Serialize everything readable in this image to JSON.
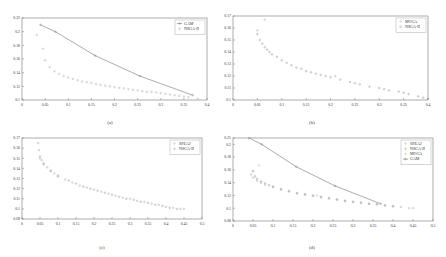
{
  "chart_data": [
    {
      "type": "scatter",
      "caption": "(a)",
      "xlim": [
        0,
        0.4
      ],
      "ylim": [
        0.1,
        0.22
      ],
      "xticks": [
        "0",
        "0.05",
        "0.1",
        "0.15",
        "0.2",
        "0.25",
        "0.3",
        "0.35",
        "0.4"
      ],
      "yticks": [
        "0.1",
        "0.12",
        "0.14",
        "0.16",
        "0.18",
        "0.2",
        "0.22"
      ],
      "legend_position": "top-right",
      "series": [
        {
          "name": "GAM",
          "style": "line-marker",
          "color": "#888888",
          "x": [
            0.04,
            0.072,
            0.158,
            0.255,
            0.369
          ],
          "y": [
            0.21,
            0.2,
            0.165,
            0.135,
            0.107
          ]
        },
        {
          "name": "NSGA-II",
          "style": "marker",
          "color": "#aaaaaa",
          "x": [
            0.032,
            0.045,
            0.05,
            0.06,
            0.07,
            0.08,
            0.09,
            0.1,
            0.11,
            0.12,
            0.13,
            0.14,
            0.15,
            0.16,
            0.17,
            0.18,
            0.19,
            0.2,
            0.21,
            0.22,
            0.23,
            0.24,
            0.25,
            0.26,
            0.27,
            0.28,
            0.29,
            0.3,
            0.31,
            0.32,
            0.33,
            0.34,
            0.35,
            0.36,
            0.38
          ],
          "y": [
            0.195,
            0.175,
            0.158,
            0.148,
            0.142,
            0.138,
            0.135,
            0.133,
            0.131,
            0.129,
            0.127,
            0.126,
            0.125,
            0.123,
            0.122,
            0.121,
            0.12,
            0.119,
            0.118,
            0.117,
            0.116,
            0.115,
            0.114,
            0.113,
            0.112,
            0.112,
            0.111,
            0.11,
            0.109,
            0.108,
            0.107,
            0.106,
            0.105,
            0.104,
            0.102
          ]
        }
      ]
    },
    {
      "type": "scatter",
      "caption": "(b)",
      "xlim": [
        0,
        0.4
      ],
      "ylim": [
        0.1,
        0.17
      ],
      "xticks": [
        "0",
        "0.05",
        "0.1",
        "0.15",
        "0.2",
        "0.25",
        "0.3",
        "0.35",
        "0.4"
      ],
      "yticks": [
        "0.1",
        "0.11",
        "0.12",
        "0.13",
        "0.14",
        "0.15",
        "0.16",
        "0.17"
      ],
      "legend_position": "top-right",
      "series": [
        {
          "name": "MOGA",
          "style": "marker",
          "color": "#aaaaaa",
          "x": [
            0.05,
            0.065,
            0.21
          ],
          "y": [
            0.158,
            0.167,
            0.12
          ]
        },
        {
          "name": "NSGA-II",
          "style": "marker",
          "color": "#999999",
          "x": [
            0.05,
            0.055,
            0.06,
            0.065,
            0.07,
            0.075,
            0.08,
            0.09,
            0.1,
            0.11,
            0.12,
            0.13,
            0.14,
            0.15,
            0.16,
            0.17,
            0.18,
            0.19,
            0.2,
            0.22,
            0.24,
            0.25,
            0.26,
            0.28,
            0.3,
            0.31,
            0.32,
            0.34,
            0.35,
            0.36,
            0.38,
            0.39,
            0.4
          ],
          "y": [
            0.155,
            0.15,
            0.147,
            0.144,
            0.142,
            0.14,
            0.138,
            0.136,
            0.133,
            0.131,
            0.129,
            0.127,
            0.126,
            0.124,
            0.123,
            0.122,
            0.121,
            0.12,
            0.119,
            0.117,
            0.115,
            0.114,
            0.113,
            0.111,
            0.11,
            0.109,
            0.108,
            0.107,
            0.106,
            0.105,
            0.103,
            0.102,
            0.101
          ]
        }
      ]
    },
    {
      "type": "scatter",
      "caption": "(c)",
      "xlim": [
        0,
        0.5
      ],
      "ylim": [
        0.09,
        0.17
      ],
      "xticks": [
        "0",
        "0.05",
        "0.1",
        "0.15",
        "0.2",
        "0.25",
        "0.3",
        "0.35",
        "0.4",
        "0.45",
        "0.5"
      ],
      "yticks": [
        "0.09",
        "0.1",
        "0.11",
        "0.12",
        "0.13",
        "0.14",
        "0.15",
        "0.16",
        "0.17"
      ],
      "legend_position": "top-right",
      "series": [
        {
          "name": "SPEA2",
          "style": "marker",
          "color": "#aaaaaa",
          "x": [
            0.045,
            0.047,
            0.05,
            0.055,
            0.06,
            0.07,
            0.08,
            0.09,
            0.1,
            0.12,
            0.14,
            0.16,
            0.18,
            0.2,
            0.22,
            0.24,
            0.26,
            0.28,
            0.3,
            0.32,
            0.34,
            0.36,
            0.38,
            0.4,
            0.42,
            0.44,
            0.45
          ],
          "y": [
            0.165,
            0.158,
            0.152,
            0.148,
            0.145,
            0.141,
            0.138,
            0.135,
            0.133,
            0.129,
            0.126,
            0.123,
            0.121,
            0.119,
            0.117,
            0.115,
            0.113,
            0.111,
            0.11,
            0.108,
            0.107,
            0.105,
            0.104,
            0.102,
            0.101,
            0.1,
            0.1
          ]
        },
        {
          "name": "NSGA-II",
          "style": "marker",
          "color": "#999999",
          "x": [
            0.05,
            0.06,
            0.08,
            0.1,
            0.13,
            0.15,
            0.17,
            0.19,
            0.21,
            0.23,
            0.25,
            0.27,
            0.29,
            0.31,
            0.33,
            0.35,
            0.37,
            0.39,
            0.41,
            0.43
          ],
          "y": [
            0.15,
            0.144,
            0.137,
            0.132,
            0.128,
            0.125,
            0.122,
            0.12,
            0.118,
            0.116,
            0.114,
            0.112,
            0.11,
            0.109,
            0.107,
            0.106,
            0.104,
            0.103,
            0.101,
            0.1
          ]
        }
      ]
    },
    {
      "type": "scatter",
      "caption": "(d)",
      "xlim": [
        0,
        0.5
      ],
      "ylim": [
        0.08,
        0.21
      ],
      "xticks": [
        "0",
        "0.05",
        "0.1",
        "0.15",
        "0.2",
        "0.25",
        "0.3",
        "0.35",
        "0.4",
        "0.45",
        "0.5"
      ],
      "yticks": [
        "0.08",
        "0.1",
        "0.12",
        "0.14",
        "0.16",
        "0.18",
        "0.2",
        "0.21"
      ],
      "legend_position": "top-right",
      "series": [
        {
          "name": "SPEA2",
          "style": "marker",
          "color": "#aaaaaa",
          "x": [
            0.045,
            0.05,
            0.06,
            0.07,
            0.08,
            0.1,
            0.12,
            0.14,
            0.16,
            0.18,
            0.2,
            0.22,
            0.24,
            0.26,
            0.28,
            0.3,
            0.32,
            0.34,
            0.36,
            0.38,
            0.4,
            0.42,
            0.44,
            0.45
          ],
          "y": [
            0.153,
            0.148,
            0.143,
            0.14,
            0.137,
            0.133,
            0.129,
            0.126,
            0.123,
            0.121,
            0.119,
            0.117,
            0.115,
            0.113,
            0.111,
            0.11,
            0.108,
            0.107,
            0.106,
            0.105,
            0.103,
            0.102,
            0.1,
            0.1
          ]
        },
        {
          "name": "NSGA-II",
          "style": "marker",
          "color": "#999999",
          "x": [
            0.05,
            0.055,
            0.06,
            0.07,
            0.08,
            0.09,
            0.1,
            0.12,
            0.14,
            0.16,
            0.18,
            0.2,
            0.22,
            0.24,
            0.26,
            0.28,
            0.3,
            0.32,
            0.34,
            0.36,
            0.38,
            0.4
          ],
          "y": [
            0.158,
            0.15,
            0.146,
            0.142,
            0.139,
            0.136,
            0.134,
            0.13,
            0.127,
            0.124,
            0.122,
            0.12,
            0.118,
            0.116,
            0.114,
            0.112,
            0.11,
            0.109,
            0.107,
            0.106,
            0.104,
            0.103
          ]
        },
        {
          "name": "MOGA",
          "style": "marker",
          "color": "#bbbbbb",
          "x": [
            0.05,
            0.065,
            0.21
          ],
          "y": [
            0.158,
            0.167,
            0.12
          ]
        },
        {
          "name": "GAM",
          "style": "line-marker",
          "color": "#888888",
          "x": [
            0.04,
            0.072,
            0.158,
            0.255,
            0.369
          ],
          "y": [
            0.21,
            0.2,
            0.165,
            0.135,
            0.107
          ]
        }
      ]
    }
  ]
}
